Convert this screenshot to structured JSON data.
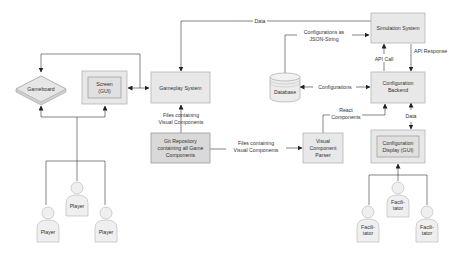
{
  "nodes": {
    "gameboard": {
      "label": "Gameboard"
    },
    "screen": {
      "line1": "Screen",
      "line2": "(GUI)"
    },
    "gameplay_system": {
      "label": "Gameplay System"
    },
    "git_repo": {
      "line1": "Git Repository",
      "line2": "containing all Game",
      "line3": "Components"
    },
    "visual_parser": {
      "line1": "Visual",
      "line2": "Component",
      "line3": "Parser"
    },
    "database": {
      "label": "Database"
    },
    "simulation_system": {
      "label": "Simulation System"
    },
    "config_backend": {
      "line1": "Configuration",
      "line2": "Backend"
    },
    "config_display": {
      "line1": "Configuration",
      "line2": "Display (GUI)"
    },
    "players": [
      {
        "label": "Player"
      },
      {
        "label": "Player"
      },
      {
        "label": "Player"
      }
    ],
    "facilitators": [
      {
        "line1": "Facili-",
        "line2": "tator"
      },
      {
        "line1": "Facili-",
        "line2": "tator"
      },
      {
        "line1": "Facili-",
        "line2": "tator"
      }
    ]
  },
  "edges": {
    "data_top": "Data",
    "files_to_gameplay_1": "Files containing",
    "files_to_gameplay_2": "Visual Components",
    "files_to_parser_1": "Files  containing",
    "files_to_parser_2": "Visual Components",
    "json_1": "Configurations as",
    "json_2": "JSON-String",
    "configurations": "Configurations",
    "api_call": "API Call",
    "api_response": "API Response",
    "react_1": "React",
    "react_2": "Components",
    "data_display": "Data"
  }
}
